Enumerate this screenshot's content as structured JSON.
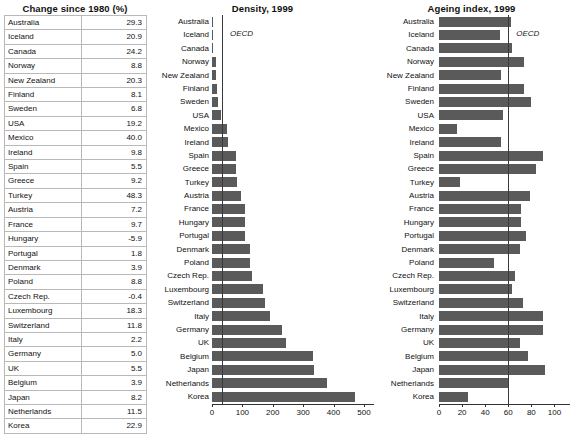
{
  "table": {
    "title": "Change since 1980 (%)",
    "columns": [
      "Country",
      "Change since 1980 (%)"
    ],
    "rows": [
      {
        "country": "Australia",
        "value": "29.3"
      },
      {
        "country": "Iceland",
        "value": "20.9"
      },
      {
        "country": "Canada",
        "value": "24.2"
      },
      {
        "country": "Norway",
        "value": "8.8"
      },
      {
        "country": "New Zealand",
        "value": "20.3"
      },
      {
        "country": "Finland",
        "value": "8.1"
      },
      {
        "country": "Sweden",
        "value": "6.8"
      },
      {
        "country": "USA",
        "value": "19.2"
      },
      {
        "country": "Mexico",
        "value": "40.0"
      },
      {
        "country": "Ireland",
        "value": "9.8"
      },
      {
        "country": "Spain",
        "value": "5.5"
      },
      {
        "country": "Greece",
        "value": "9.2"
      },
      {
        "country": "Turkey",
        "value": "48.3"
      },
      {
        "country": "Austria",
        "value": "7.2"
      },
      {
        "country": "France",
        "value": "9.7"
      },
      {
        "country": "Hungary",
        "value": "-5.9"
      },
      {
        "country": "Portugal",
        "value": "1.8"
      },
      {
        "country": "Denmark",
        "value": "3.9"
      },
      {
        "country": "Poland",
        "value": "8.8"
      },
      {
        "country": "Czech Rep.",
        "value": "-0.4"
      },
      {
        "country": "Luxembourg",
        "value": "18.3"
      },
      {
        "country": "Switzerland",
        "value": "11.8"
      },
      {
        "country": "Italy",
        "value": "2.2"
      },
      {
        "country": "Germany",
        "value": "5.0"
      },
      {
        "country": "UK",
        "value": "5.5"
      },
      {
        "country": "Belgium",
        "value": "3.9"
      },
      {
        "country": "Japan",
        "value": "8.2"
      },
      {
        "country": "Netherlands",
        "value": "11.5"
      },
      {
        "country": "Korea",
        "value": "22.9"
      }
    ]
  },
  "chart_data": [
    {
      "type": "bar",
      "orientation": "horizontal",
      "title": "Density, 1999",
      "xlabel": "",
      "ylabel": "",
      "xlim": [
        0,
        520
      ],
      "ticks": [
        0,
        100,
        200,
        300,
        400,
        500
      ],
      "grid": false,
      "legend": "none",
      "reference_line": {
        "label": "OECD",
        "value": 33
      },
      "categories": [
        "Australia",
        "Iceland",
        "Canada",
        "Norway",
        "New Zealand",
        "Finland",
        "Sweden",
        "USA",
        "Mexico",
        "Ireland",
        "Spain",
        "Greece",
        "Turkey",
        "Austria",
        "France",
        "Hungary",
        "Portugal",
        "Denmark",
        "Poland",
        "Czech Rep.",
        "Luxembourg",
        "Switzerland",
        "Italy",
        "Germany",
        "UK",
        "Belgium",
        "Japan",
        "Netherlands",
        "Korea"
      ],
      "values": [
        2,
        3,
        3,
        14,
        14,
        15,
        20,
        29,
        50,
        53,
        79,
        80,
        83,
        96,
        107,
        108,
        109,
        124,
        124,
        131,
        168,
        176,
        192,
        230,
        243,
        333,
        336,
        378,
        472
      ]
    },
    {
      "type": "bar",
      "orientation": "horizontal",
      "title": "Ageing index, 1999",
      "xlabel": "",
      "ylabel": "",
      "xlim": [
        0,
        110
      ],
      "ticks": [
        0,
        20,
        40,
        60,
        80,
        100
      ],
      "grid": false,
      "legend": "none",
      "reference_line": {
        "label": "OECD",
        "value": 60
      },
      "categories": [
        "Australia",
        "Iceland",
        "Canada",
        "Norway",
        "New Zealand",
        "Finland",
        "Sweden",
        "USA",
        "Mexico",
        "Ireland",
        "Spain",
        "Greece",
        "Turkey",
        "Austria",
        "France",
        "Hungary",
        "Portugal",
        "Denmark",
        "Poland",
        "Czech Rep.",
        "Luxembourg",
        "Switzerland",
        "Italy",
        "Germany",
        "UK",
        "Belgium",
        "Japan",
        "Netherlands",
        "Korea"
      ],
      "values": [
        62,
        53,
        63,
        74,
        54,
        74,
        80,
        55,
        16,
        54,
        90,
        84,
        18,
        79,
        71,
        71,
        75,
        70,
        48,
        66,
        63,
        73,
        90,
        90,
        70,
        77,
        92,
        61,
        25
      ]
    }
  ]
}
